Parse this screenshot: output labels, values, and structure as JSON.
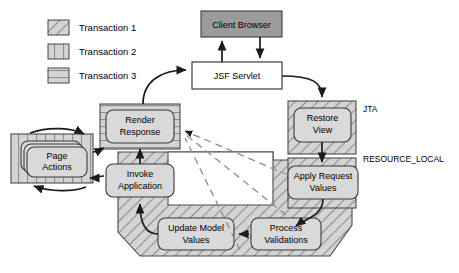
{
  "legend": {
    "items": [
      {
        "label": "Transaction 1",
        "pattern": "diagonal-hatch-swatch"
      },
      {
        "label": "Transaction 2",
        "pattern": "vertical-hatch-swatch"
      },
      {
        "label": "Transaction 3",
        "pattern": "horizontal-hatch-swatch"
      }
    ]
  },
  "nodes": {
    "client_browser": "Client Browser",
    "jsf_servlet": "JSF Servlet",
    "render_response_l1": "Render",
    "render_response_l2": "Response",
    "restore_view_l1": "Restore",
    "restore_view_l2": "View",
    "page_actions_l1": "Page",
    "page_actions_l2": "Actions",
    "invoke_application_l1": "Invoke",
    "invoke_application_l2": "Application",
    "apply_request_values_l1": "Apply Request",
    "apply_request_values_l2": "Values",
    "update_model_values_l1": "Update Model",
    "update_model_values_l2": "Values",
    "process_validations_l1": "Process",
    "process_validations_l2": "Validations"
  },
  "annotations": {
    "jta": "JTA",
    "resource_local": "RESOURCE_LOCAL"
  },
  "colors": {
    "browser_fill": "#9b9b9b",
    "servlet_fill": "#ffffff",
    "node_fill": "#d9d9d9",
    "hatch_bg": "#d0d0d0",
    "stroke": "#3a3a3a",
    "dashed": "#8d8d8d"
  }
}
